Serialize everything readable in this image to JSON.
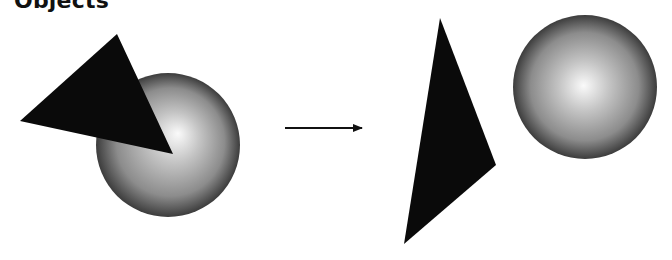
{
  "heading": "Objects",
  "scene": {
    "before": {
      "triangle": {
        "points": "117,34 20,121 173,154",
        "color": "#0a0a0a"
      },
      "sphere": {
        "cx": 168,
        "cy": 145,
        "r": 72,
        "highlight_fx": "0.12",
        "highlight_fy": "0.1"
      }
    },
    "arrow": {
      "x1": 285,
      "y1": 128,
      "x2": 362,
      "y2": 128
    },
    "after": {
      "triangle": {
        "points": "440,18 496,165 404,244",
        "color": "#0a0a0a"
      },
      "sphere": {
        "cx": 585,
        "cy": 87,
        "r": 72
      }
    }
  },
  "colors": {
    "background": "#ffffff",
    "sphere_light": "#fafafa",
    "sphere_mid": "#a8a8a8",
    "sphere_dark": "#3c3c3c",
    "arrow": "#111111"
  }
}
